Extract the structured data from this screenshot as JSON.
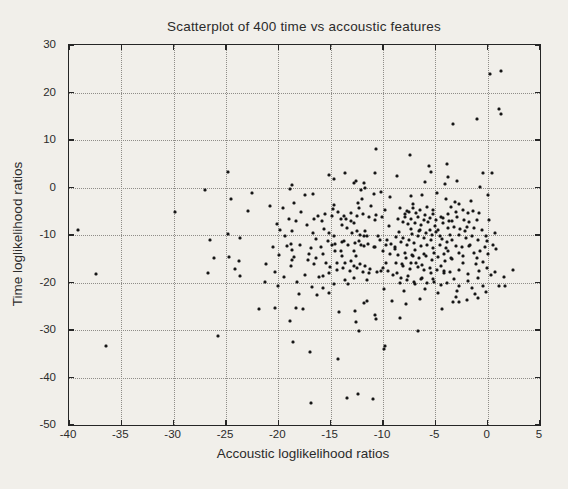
{
  "figure": {
    "background": "#f1efea",
    "ink_color": "#262626",
    "grid_color": "#8f8d88"
  },
  "chart_data": {
    "type": "scatter",
    "title": "Scatterplot of 400 time vs accoustic features",
    "xlabel": "Accoustic loglikelihood ratios",
    "ylabel": "Time loglikelihood ratios",
    "xlim": [
      -40,
      5
    ],
    "ylim": [
      -50,
      30
    ],
    "x_ticks": [
      -40,
      -35,
      -30,
      -25,
      -20,
      -15,
      -10,
      -5,
      0,
      5
    ],
    "y_ticks": [
      30,
      20,
      10,
      0,
      -10,
      -20,
      -30,
      -40,
      -50
    ],
    "grid": true,
    "grid_style": "dotted",
    "legend": "none",
    "marker": {
      "shape": "dot",
      "color": "#161616",
      "size_px": 3
    },
    "n_points": 400,
    "points": [
      [
        -39.1,
        -9.0
      ],
      [
        -37.4,
        -18.3
      ],
      [
        -36.5,
        -33.3
      ],
      [
        -29.9,
        -5.1
      ],
      [
        -27.0,
        -0.6
      ],
      [
        -26.5,
        -11.0
      ],
      [
        -26.1,
        -14.9
      ],
      [
        -26.7,
        -18.1
      ],
      [
        -25.8,
        -31.3
      ],
      [
        -24.8,
        3.2
      ],
      [
        -22.5,
        -1.1
      ],
      [
        -24.5,
        -2.5
      ],
      [
        -22.9,
        -5.0
      ],
      [
        -24.8,
        -9.7
      ],
      [
        -23.7,
        -10.6
      ],
      [
        -24.7,
        -14.6
      ],
      [
        -23.8,
        -15.5
      ],
      [
        -24.1,
        -17.1
      ],
      [
        -23.7,
        -18.7
      ],
      [
        -21.2,
        -16.2
      ],
      [
        -21.3,
        -19.9
      ],
      [
        -18.7,
        0.6
      ],
      [
        -18.9,
        -0.3
      ],
      [
        -19.6,
        -4.3
      ],
      [
        -18.5,
        -3.2
      ],
      [
        -17.5,
        -1.5
      ],
      [
        -16.7,
        -1.3
      ],
      [
        -18.3,
        -7.1
      ],
      [
        -18.7,
        -9.2
      ],
      [
        -19.4,
        -10.3
      ],
      [
        -18.8,
        -11.8
      ],
      [
        -18.7,
        -13.1
      ],
      [
        -18.5,
        -14.6
      ],
      [
        -18.7,
        -15.3
      ],
      [
        -17.9,
        -12.0
      ],
      [
        -17.1,
        -14.1
      ],
      [
        -16.6,
        -6.7
      ],
      [
        -16.4,
        -10.8
      ],
      [
        -15.7,
        -14.1
      ],
      [
        -15.4,
        -15.9
      ],
      [
        -15.7,
        -18.7
      ],
      [
        -15.2,
        -18.1
      ],
      [
        -14.7,
        1.7
      ],
      [
        -15.2,
        2.7
      ],
      [
        -13.6,
        3.1
      ],
      [
        -12.8,
        1.0
      ],
      [
        -12.6,
        1.3
      ],
      [
        -11.8,
        1.0
      ],
      [
        -11.7,
        -0.1
      ],
      [
        -12.1,
        -0.6
      ],
      [
        -12.0,
        -2.5
      ],
      [
        -12.4,
        -3.2
      ],
      [
        -12.3,
        -4.3
      ],
      [
        -14.7,
        -3.6
      ],
      [
        -14.8,
        -4.6
      ],
      [
        -14.0,
        -6.7
      ],
      [
        -13.5,
        -6.6
      ],
      [
        -13.1,
        -7.1
      ],
      [
        -12.8,
        -7.4
      ],
      [
        -13.9,
        -7.8
      ],
      [
        -13.4,
        -8.5
      ],
      [
        -13.0,
        -9.5
      ],
      [
        -12.5,
        -9.2
      ],
      [
        -12.2,
        -9.9
      ],
      [
        -11.7,
        -9.2
      ],
      [
        -11.8,
        -10.3
      ],
      [
        -11.5,
        -10.3
      ],
      [
        -12.3,
        -11.3
      ],
      [
        -11.8,
        -12.4
      ],
      [
        -12.8,
        -13.4
      ],
      [
        -12.6,
        -14.5
      ],
      [
        -13.7,
        -11.3
      ],
      [
        -14.7,
        -10.3
      ],
      [
        -15.7,
        -21.1
      ],
      [
        -16.1,
        -18.8
      ],
      [
        -14.7,
        -20.4
      ],
      [
        -13.6,
        -19.4
      ],
      [
        -13.3,
        -20.4
      ],
      [
        -12.8,
        -19.0
      ],
      [
        -11.5,
        -19.4
      ],
      [
        -11.3,
        -18.0
      ],
      [
        -18.0,
        -22.5
      ],
      [
        -16.3,
        -22.7
      ],
      [
        -15.2,
        -22.2
      ],
      [
        -18.8,
        -16.6
      ],
      [
        -16.7,
        -9.5
      ],
      [
        -15.6,
        -8.8
      ],
      [
        -15.2,
        -9.5
      ],
      [
        -14.9,
        -12.0
      ],
      [
        -14.6,
        -13.4
      ],
      [
        -14.0,
        -13.4
      ],
      [
        -13.9,
        -14.5
      ],
      [
        -14.4,
        -15.9
      ],
      [
        -13.6,
        -15.9
      ],
      [
        -13.1,
        -15.5
      ],
      [
        -12.8,
        -16.6
      ],
      [
        -12.2,
        -16.2
      ],
      [
        -11.7,
        -16.6
      ],
      [
        -16.6,
        -16.2
      ],
      [
        -17.2,
        -15.2
      ],
      [
        -10.8,
        3.0
      ],
      [
        -8.7,
        2.5
      ],
      [
        -5.4,
        3.2
      ],
      [
        -3.8,
        2.3
      ],
      [
        -6.0,
        1.1
      ],
      [
        -4.1,
        0.8
      ],
      [
        -10.9,
        -1.3
      ],
      [
        -10.2,
        -0.9
      ],
      [
        -9.3,
        -1.9
      ],
      [
        -7.3,
        -1.7
      ],
      [
        -6.3,
        -1.5
      ],
      [
        -4.8,
        -1.2
      ],
      [
        -4.0,
        -2.4
      ],
      [
        -7.1,
        -3.4
      ],
      [
        -11.1,
        -3.8
      ],
      [
        -9.8,
        -4.8
      ],
      [
        -7.9,
        -5.5
      ],
      [
        -7.5,
        -5.1
      ],
      [
        -6.8,
        -5.3
      ],
      [
        -6.0,
        -5.8
      ],
      [
        -5.2,
        -5.5
      ],
      [
        -4.5,
        -6.2
      ],
      [
        -3.8,
        -5.5
      ],
      [
        -10.8,
        -6.9
      ],
      [
        -9.4,
        -8.0
      ],
      [
        -8.1,
        -7.3
      ],
      [
        -7.6,
        -7.6
      ],
      [
        -6.9,
        -7.4
      ],
      [
        -6.4,
        -7.8
      ],
      [
        -5.7,
        -7.3
      ],
      [
        -5.0,
        -8.0
      ],
      [
        -4.3,
        -7.4
      ],
      [
        -7.3,
        -8.7
      ],
      [
        -6.5,
        -8.9
      ],
      [
        -5.5,
        -9.0
      ],
      [
        -4.7,
        -8.9
      ],
      [
        -3.8,
        -8.5
      ],
      [
        -10.5,
        -10.3
      ],
      [
        -9.6,
        -11.0
      ],
      [
        -8.8,
        -10.5
      ],
      [
        -8.1,
        -10.7
      ],
      [
        -7.5,
        -11.0
      ],
      [
        -6.7,
        -10.3
      ],
      [
        -6.1,
        -10.7
      ],
      [
        -5.4,
        -11.0
      ],
      [
        -4.6,
        -10.3
      ],
      [
        -3.9,
        -11.5
      ],
      [
        -9.2,
        -11.8
      ],
      [
        -10.9,
        -12.6
      ],
      [
        -10.0,
        -13.3
      ],
      [
        -8.9,
        -13.0
      ],
      [
        -7.9,
        -13.7
      ],
      [
        -6.9,
        -13.2
      ],
      [
        -7.1,
        -14.4
      ],
      [
        -6.1,
        -14.1
      ],
      [
        -5.1,
        -13.7
      ],
      [
        -4.2,
        -14.1
      ],
      [
        -3.8,
        -13.3
      ],
      [
        -9.7,
        -15.8
      ],
      [
        -8.2,
        -16.1
      ],
      [
        -7.3,
        -15.8
      ],
      [
        -6.8,
        -15.9
      ],
      [
        -6.3,
        -16.4
      ],
      [
        -5.5,
        -16.9
      ],
      [
        -4.5,
        -16.5
      ],
      [
        -10.2,
        -17.5
      ],
      [
        -8.7,
        -17.9
      ],
      [
        -7.6,
        -18.6
      ],
      [
        -6.3,
        -19.0
      ],
      [
        -5.2,
        -19.2
      ],
      [
        -8.4,
        -20.0
      ],
      [
        -6.9,
        -20.4
      ],
      [
        -4.2,
        -17.5
      ],
      [
        -9.9,
        -21.4
      ],
      [
        -8.0,
        -21.8
      ],
      [
        -6.0,
        -21.4
      ],
      [
        -4.7,
        -22.2
      ],
      [
        -9.1,
        -23.8
      ],
      [
        -6.5,
        -23.4
      ],
      [
        -0.4,
        3.0
      ],
      [
        0.4,
        3.0
      ],
      [
        -2.9,
        1.3
      ],
      [
        -0.7,
        0.1
      ],
      [
        0.0,
        -1.5
      ],
      [
        -3.1,
        -3.1
      ],
      [
        -2.7,
        -3.4
      ],
      [
        -1.6,
        -2.9
      ],
      [
        -3.5,
        -4.0
      ],
      [
        -3.0,
        -5.1
      ],
      [
        -2.4,
        -4.8
      ],
      [
        -1.9,
        -5.3
      ],
      [
        -1.4,
        -4.9
      ],
      [
        -0.8,
        -5.3
      ],
      [
        -2.9,
        -6.2
      ],
      [
        -2.3,
        -6.8
      ],
      [
        -3.4,
        -7.0
      ],
      [
        -1.8,
        -7.3
      ],
      [
        -1.0,
        -6.9
      ],
      [
        0.1,
        -6.9
      ],
      [
        -3.2,
        -8.3
      ],
      [
        -2.6,
        -8.8
      ],
      [
        -2.0,
        -8.4
      ],
      [
        -2.7,
        -10.1
      ],
      [
        -2.1,
        -10.6
      ],
      [
        -1.5,
        -10.3
      ],
      [
        -0.9,
        -11.0
      ],
      [
        -0.2,
        -10.3
      ],
      [
        -0.1,
        -11.3
      ],
      [
        -3.4,
        -11.0
      ],
      [
        0.7,
        -9.6
      ],
      [
        -3.0,
        -12.3
      ],
      [
        -2.5,
        -12.6
      ],
      [
        -1.8,
        -12.3
      ],
      [
        -2.7,
        -13.8
      ],
      [
        -1.3,
        -13.8
      ],
      [
        -0.7,
        -13.4
      ],
      [
        0.0,
        -14.1
      ],
      [
        0.8,
        -13.0
      ],
      [
        -3.4,
        -15.0
      ],
      [
        -2.4,
        -15.8
      ],
      [
        -1.1,
        -16.1
      ],
      [
        -0.4,
        -15.6
      ],
      [
        -2.7,
        -17.3
      ],
      [
        -0.8,
        -17.5
      ],
      [
        0.7,
        -17.8
      ],
      [
        2.4,
        -17.3
      ],
      [
        -3.2,
        -19.2
      ],
      [
        -1.9,
        -19.6
      ],
      [
        -0.9,
        -19.1
      ],
      [
        -2.7,
        -20.8
      ],
      [
        -1.5,
        -21.1
      ],
      [
        -0.4,
        -20.8
      ],
      [
        1.1,
        -20.7
      ],
      [
        1.7,
        -20.8
      ],
      [
        -3.0,
        -23.0
      ],
      [
        -2.0,
        -23.7
      ],
      [
        -0.9,
        -23.3
      ],
      [
        1.6,
        -18.9
      ],
      [
        0.2,
        24.0
      ],
      [
        1.3,
        24.5
      ],
      [
        1.1,
        16.5
      ],
      [
        1.3,
        15.5
      ],
      [
        -1.0,
        14.5
      ],
      [
        -3.3,
        13.3
      ],
      [
        -10.7,
        8.2
      ],
      [
        -7.4,
        6.8
      ],
      [
        -5.6,
        4.5
      ],
      [
        -3.9,
        5.0
      ],
      [
        -21.8,
        -25.6
      ],
      [
        -20.3,
        -25.4
      ],
      [
        -18.3,
        -25.3
      ],
      [
        -17.6,
        -25.6
      ],
      [
        -18.9,
        -28.2
      ],
      [
        -18.6,
        -32.6
      ],
      [
        -17.0,
        -34.7
      ],
      [
        -14.2,
        -26.3
      ],
      [
        -12.7,
        -26.1
      ],
      [
        -11.8,
        -24.4
      ],
      [
        -11.5,
        -23.9
      ],
      [
        -12.6,
        -28.4
      ],
      [
        -12.3,
        -30.3
      ],
      [
        -14.3,
        -36.2
      ],
      [
        -16.9,
        -45.3
      ],
      [
        -13.4,
        -44.4
      ],
      [
        -12.4,
        -43.5
      ],
      [
        -11.0,
        -44.5
      ],
      [
        -7.8,
        -24.6
      ],
      [
        -3.3,
        -24.1
      ],
      [
        -2.7,
        -24.2
      ],
      [
        -4.4,
        -25.5
      ],
      [
        -10.8,
        -26.8
      ],
      [
        -10.7,
        -27.7
      ],
      [
        -8.4,
        -27.4
      ],
      [
        -6.7,
        -30.3
      ],
      [
        -9.8,
        -33.3
      ],
      [
        -9.9,
        -34.1
      ],
      [
        -8.5,
        -9.3
      ],
      [
        -7.2,
        -9.8
      ],
      [
        -6.6,
        -9.1
      ],
      [
        -5.9,
        -9.6
      ],
      [
        -5.3,
        -10.1
      ],
      [
        -4.9,
        -9.4
      ],
      [
        -4.4,
        -10.9
      ],
      [
        -3.6,
        -10.1
      ],
      [
        -8.3,
        -11.4
      ],
      [
        -7.7,
        -12.1
      ],
      [
        -7.0,
        -11.7
      ],
      [
        -6.4,
        -12.4
      ],
      [
        -5.8,
        -12.0
      ],
      [
        -5.2,
        -12.7
      ],
      [
        -4.6,
        -12.2
      ],
      [
        -4.0,
        -12.8
      ],
      [
        -8.9,
        -12.6
      ],
      [
        -9.3,
        -13.9
      ],
      [
        -8.6,
        -14.3
      ],
      [
        -7.8,
        -14.8
      ],
      [
        -7.2,
        -14.2
      ],
      [
        -6.6,
        -14.9
      ],
      [
        -5.9,
        -14.4
      ],
      [
        -5.3,
        -15.2
      ],
      [
        -4.7,
        -14.7
      ],
      [
        -4.1,
        -15.4
      ],
      [
        -3.5,
        -14.9
      ],
      [
        -8.8,
        -15.9
      ],
      [
        -8.1,
        -16.6
      ],
      [
        -7.4,
        -17.2
      ],
      [
        -6.7,
        -16.8
      ],
      [
        -6.1,
        -17.4
      ],
      [
        -5.4,
        -17.9
      ],
      [
        -4.8,
        -17.3
      ],
      [
        -4.2,
        -18.1
      ],
      [
        -3.6,
        -17.7
      ],
      [
        -9.0,
        -18.4
      ],
      [
        -8.3,
        -19.0
      ],
      [
        -7.7,
        -19.5
      ],
      [
        -7.0,
        -19.9
      ],
      [
        -6.4,
        -19.3
      ],
      [
        -5.8,
        -20.1
      ],
      [
        -5.1,
        -19.8
      ],
      [
        -4.5,
        -20.5
      ],
      [
        -3.9,
        -20.0
      ],
      [
        -8.6,
        -6.6
      ],
      [
        -7.9,
        -6.2
      ],
      [
        -7.3,
        -6.7
      ],
      [
        -6.7,
        -6.3
      ],
      [
        -6.1,
        -6.8
      ],
      [
        -5.5,
        -6.4
      ],
      [
        -4.9,
        -6.9
      ],
      [
        -4.3,
        -6.5
      ],
      [
        -3.7,
        -7.0
      ],
      [
        -8.4,
        -4.4
      ],
      [
        -7.7,
        -4.9
      ],
      [
        -7.1,
        -4.3
      ],
      [
        -6.5,
        -4.8
      ],
      [
        -5.8,
        -4.2
      ],
      [
        -5.2,
        -4.7
      ],
      [
        -15.5,
        -5.5
      ],
      [
        -14.9,
        -6.1
      ],
      [
        -14.3,
        -5.2
      ],
      [
        -13.7,
        -5.9
      ],
      [
        -13.1,
        -5.3
      ],
      [
        -12.5,
        -6.0
      ],
      [
        -11.9,
        -5.6
      ],
      [
        -11.3,
        -6.2
      ],
      [
        -10.7,
        -5.8
      ],
      [
        -10.1,
        -6.3
      ],
      [
        -15.3,
        -11.2
      ],
      [
        -14.6,
        -11.8
      ],
      [
        -13.9,
        -11.4
      ],
      [
        -13.3,
        -12.1
      ],
      [
        -12.7,
        -11.6
      ],
      [
        -12.1,
        -12.2
      ],
      [
        -11.4,
        -11.9
      ],
      [
        -10.8,
        -12.5
      ],
      [
        -10.3,
        -11.1
      ],
      [
        -9.7,
        -12.0
      ],
      [
        -15.1,
        -16.8
      ],
      [
        -14.4,
        -17.3
      ],
      [
        -13.8,
        -16.9
      ],
      [
        -13.2,
        -17.5
      ],
      [
        -12.5,
        -17.0
      ],
      [
        -11.9,
        -17.7
      ],
      [
        -11.2,
        -17.2
      ],
      [
        -10.6,
        -17.8
      ],
      [
        -10.0,
        -16.9
      ],
      [
        -9.5,
        -17.6
      ],
      [
        -20.8,
        -3.9
      ],
      [
        -20.1,
        -7.7
      ],
      [
        -19.8,
        -8.9
      ],
      [
        -20.5,
        -12.6
      ],
      [
        -19.9,
        -14.2
      ],
      [
        -20.3,
        -17.8
      ],
      [
        -19.5,
        -18.9
      ],
      [
        -20.0,
        -20.7
      ],
      [
        -19.2,
        -12.4
      ],
      [
        -19.0,
        -6.6
      ],
      [
        -17.8,
        -5.1
      ],
      [
        -17.3,
        -7.9
      ],
      [
        -16.9,
        -12.7
      ],
      [
        -17.5,
        -18.4
      ],
      [
        -16.8,
        -20.9
      ],
      [
        -18.2,
        -19.8
      ],
      [
        -16.2,
        -5.9
      ],
      [
        -15.9,
        -12.5
      ],
      [
        -16.4,
        -14.8
      ],
      [
        -15.8,
        -7.1
      ],
      [
        -2.2,
        -9.1
      ],
      [
        -1.3,
        -8.6
      ],
      [
        -0.5,
        -8.9
      ],
      [
        -1.7,
        -12.0
      ],
      [
        -0.3,
        -12.6
      ],
      [
        -2.4,
        -14.4
      ],
      [
        -1.0,
        -14.8
      ],
      [
        -0.1,
        -16.9
      ],
      [
        -1.9,
        -18.2
      ],
      [
        -2.9,
        -21.8
      ],
      [
        -1.2,
        -22.4
      ],
      [
        -0.2,
        -22.0
      ],
      [
        0.3,
        -18.5
      ],
      [
        0.5,
        -12.2
      ]
    ]
  }
}
